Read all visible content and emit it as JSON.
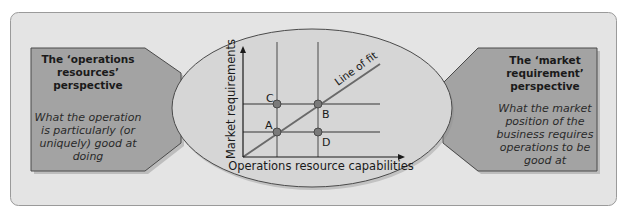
{
  "left_box": {
    "title_lines": [
      "The ‘operations",
      "resources’",
      "perspective"
    ],
    "desc_lines": [
      "What the operation",
      "is particularly (or",
      "uniquely) good at",
      "doing"
    ]
  },
  "right_box": {
    "title_lines": [
      "The ‘market",
      "requirement’",
      "perspective"
    ],
    "desc_lines": [
      "What the market",
      "position of the",
      "business requires",
      "operations to be",
      "good at"
    ]
  },
  "chart": {
    "x_axis_label": "Operations resource capabilities",
    "y_axis_label": "Market requirements",
    "line_label": "Line of fit",
    "points": [
      {
        "label": "A",
        "position": "lower-left"
      },
      {
        "label": "B",
        "position": "upper-right"
      },
      {
        "label": "C",
        "position": "upper-left"
      },
      {
        "label": "D",
        "position": "lower-right"
      }
    ]
  },
  "colors": {
    "background_panel": "#e4e4e4",
    "box_fill": "#a3a3a3",
    "box_border": "#4a4a4a",
    "ellipse_fill": "#d6d6d6",
    "line": "#6a6a6a",
    "point": "#7a7a7a"
  }
}
